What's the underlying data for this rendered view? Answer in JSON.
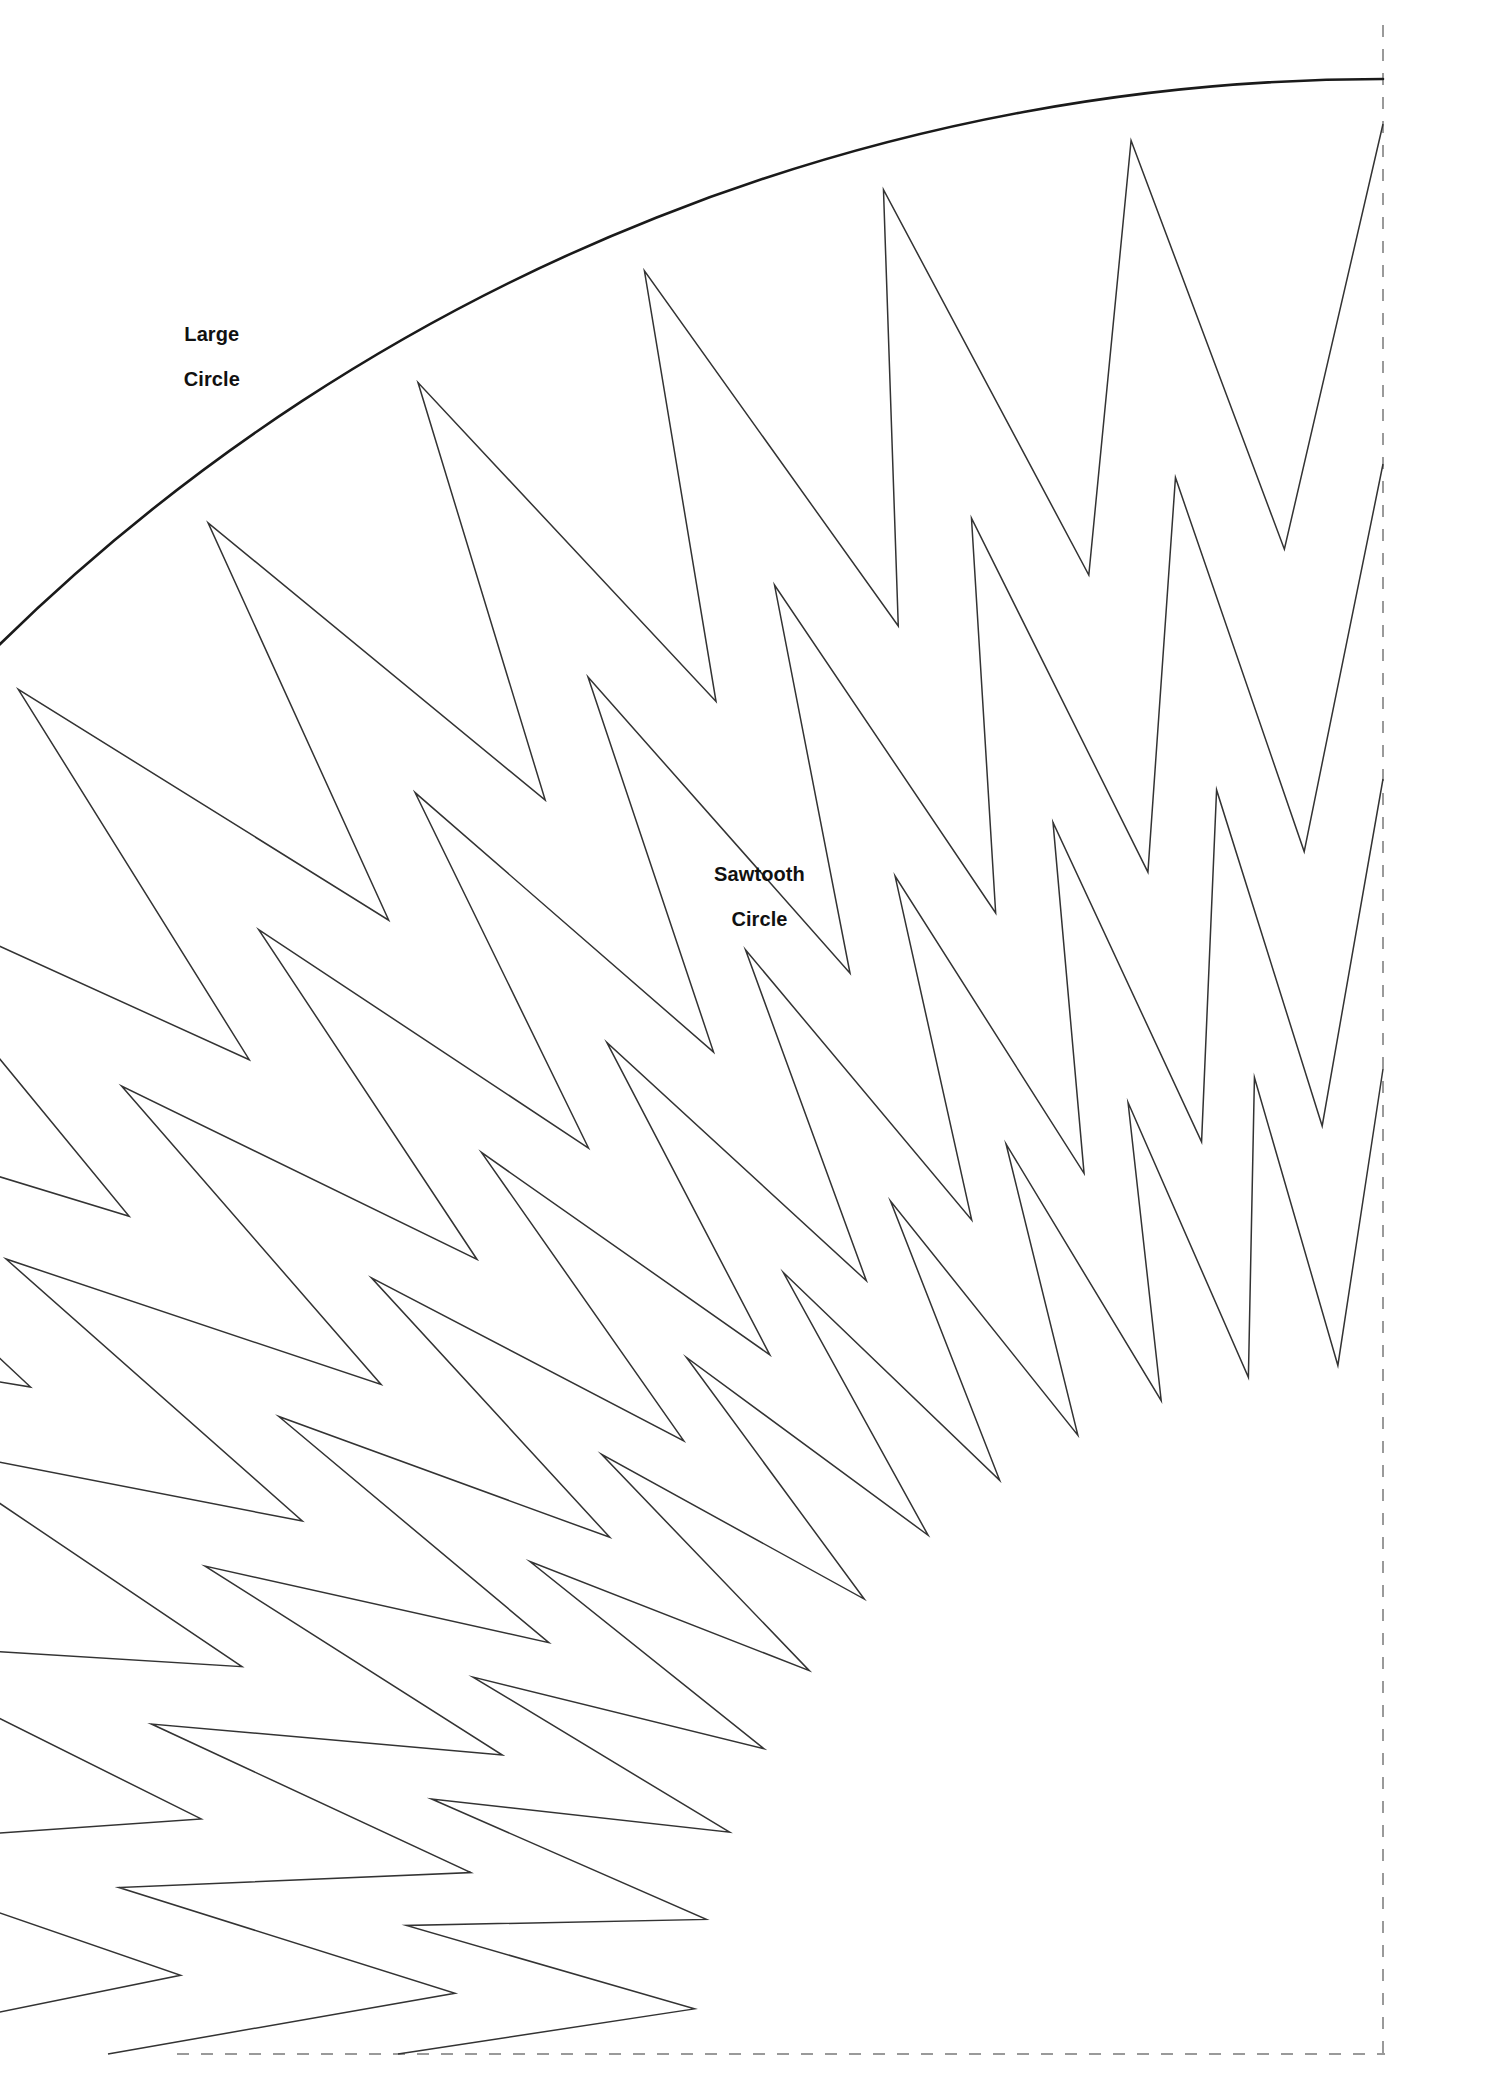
{
  "page": {
    "background_color": "#ffffff",
    "width": 1485,
    "height": 2100
  },
  "labels": {
    "large_circle": "Large\nCircle",
    "large_circle_line1": "Large",
    "large_circle_line2": "Circle",
    "sawtooth_circle": "Sawtooth\nCircle",
    "sawtooth_circle_line1": "Sawtooth",
    "sawtooth_circle_line2": "Circle"
  },
  "colors": {
    "outline": "#1a1a1a",
    "thin_outline": "#333333",
    "guide_dashed": "#999999",
    "paper": "#ffffff",
    "text": "#111111"
  },
  "chart_data": {
    "type": "diagram",
    "guides": {
      "fold_line_vertical_x": 1383,
      "fold_line_vertical_y_start": 25,
      "fold_line_vertical_y_end": 2056,
      "fold_line_horizontal_y": 2054,
      "fold_line_horizontal_x_start": 177,
      "fold_line_horizontal_x_end": 1385,
      "dash_pattern": "12 12",
      "stroke_width": 2
    },
    "large_circle": {
      "label": "Large Circle",
      "origin_x": 1383,
      "origin_y": 2054,
      "radius": 1975,
      "arc_start": [
        1383,
        79
      ],
      "arc_end": [
        196,
        2054
      ],
      "stroke_width": 2.6
    },
    "sawtooth_circle": {
      "label": "Sawtooth Circle",
      "origin_x": 1383,
      "origin_y": 2054,
      "tooth_count": 12,
      "outer_radius": 1930,
      "inner_radius": 1508,
      "angle_start_deg": 180,
      "angle_end_deg": 270,
      "stroke_width": 1.5
    },
    "nested_sawtooth_rings": [
      {
        "outer_radius": 1930,
        "inner_radius": 1508,
        "phase_deg": 0.0
      },
      {
        "outer_radius": 1590,
        "inner_radius": 1205,
        "phase_deg": 0.0
      },
      {
        "outer_radius": 1275,
        "inner_radius": 930,
        "phase_deg": 0.0
      },
      {
        "outer_radius": 985,
        "inner_radius": 690,
        "phase_deg": 0.0
      }
    ]
  }
}
